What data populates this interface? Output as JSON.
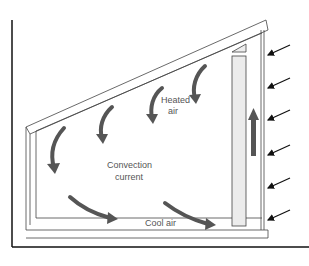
{
  "diagram": {
    "title": "",
    "labels": {
      "heated_air": [
        "Heated",
        "air"
      ],
      "convection": [
        "Convection",
        "current"
      ],
      "cool_air": "Cool air"
    },
    "colors": {
      "flow_arrow": "#555555",
      "frame_line": "#444444",
      "sun_arrow": "#111111",
      "insulation_fill": "#ececec"
    },
    "elements": {
      "incoming_radiation_arrows": 6,
      "convection_arrows": 6,
      "upward_arrow": 1
    }
  }
}
